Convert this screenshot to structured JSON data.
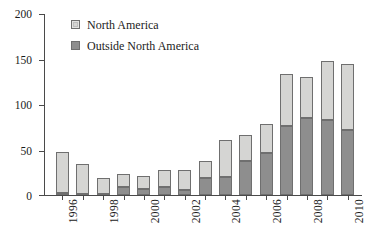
{
  "chart_data": {
    "type": "bar",
    "title": "",
    "subtitle": "",
    "xlabel": "",
    "ylabel": "",
    "stacked": true,
    "grid": false,
    "legend_position": "top-left-inside",
    "ylim": [
      0,
      200
    ],
    "ytick_labels": [
      "0",
      "50",
      "100",
      "150",
      "200"
    ],
    "ytick_values": [
      0,
      50,
      100,
      150,
      200
    ],
    "categories": [
      "1996",
      "1997",
      "1998",
      "1999",
      "2000",
      "2001",
      "2002",
      "2003",
      "2004",
      "2005",
      "2006",
      "2007",
      "2008",
      "2009",
      "2010"
    ],
    "xtick_labels_shown": [
      "1996",
      "1998",
      "2000",
      "2002",
      "2004",
      "2006",
      "2008",
      "2010"
    ],
    "xtick_label_rotation": 90,
    "series": [
      {
        "name": "Outside North America",
        "color": "#8e8e8e",
        "values": [
          2,
          1,
          1,
          9,
          7,
          9,
          6,
          19,
          20,
          38,
          46,
          76,
          85,
          83,
          72
        ]
      },
      {
        "name": "North America",
        "color": "#d5d5d3",
        "values": [
          45,
          33,
          18,
          14,
          14,
          19,
          22,
          19,
          41,
          28,
          33,
          58,
          45,
          65,
          73
        ]
      }
    ],
    "totals": [
      47,
      34,
      19,
      23,
      21,
      28,
      28,
      38,
      61,
      66,
      79,
      134,
      130,
      148,
      145
    ]
  },
  "legend": {
    "items": [
      {
        "label": "North America",
        "swatch": "light-gray-swatch"
      },
      {
        "label": "Outside North America",
        "swatch": "dark-gray-swatch"
      }
    ]
  },
  "caption": {
    "text": ""
  }
}
